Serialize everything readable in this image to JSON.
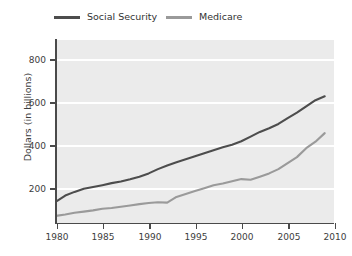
{
  "chart_data": {
    "type": "line",
    "title": "",
    "xlabel": "",
    "ylabel": "Dollars (in billions)",
    "xlim": [
      1980,
      2010
    ],
    "ylim": [
      0,
      900
    ],
    "xticks": [
      1980,
      1985,
      1990,
      1995,
      2000,
      2005,
      2010
    ],
    "yticks": [
      200,
      400,
      600,
      800
    ],
    "grid": "horizontal",
    "legend_position": "top",
    "x": [
      1980,
      1981,
      1982,
      1983,
      1984,
      1985,
      1986,
      1987,
      1988,
      1989,
      1990,
      1991,
      1992,
      1993,
      1994,
      1995,
      1996,
      1997,
      1998,
      1999,
      2000,
      2001,
      2002,
      2003,
      2004,
      2005,
      2006,
      2007,
      2008,
      2009
    ],
    "series": [
      {
        "name": "Social Security",
        "color": "#4d4d4d",
        "values": [
          105,
          135,
          153,
          168,
          177,
          186,
          196,
          204,
          215,
          228,
          244,
          265,
          283,
          299,
          313,
          328,
          343,
          358,
          372,
          385,
          402,
          425,
          448,
          466,
          487,
          516,
          543,
          574,
          604,
          623
        ]
      },
      {
        "name": "Medicare",
        "color": "#9a9a9a",
        "values": [
          35,
          42,
          50,
          56,
          62,
          70,
          74,
          80,
          86,
          93,
          98,
          102,
          100,
          128,
          143,
          157,
          171,
          186,
          194,
          205,
          216,
          213,
          228,
          244,
          265,
          295,
          324,
          368,
          400,
          442
        ]
      }
    ]
  },
  "legend": {
    "entries": [
      {
        "label": "Social Security",
        "color": "#4d4d4d"
      },
      {
        "label": "Medicare",
        "color": "#9a9a9a"
      }
    ]
  },
  "axes": {
    "y_title": "Dollars (in billions)",
    "y_tick_labels": [
      "200",
      "400",
      "600",
      "800"
    ],
    "x_tick_labels": [
      "1980",
      "1985",
      "1990",
      "1995",
      "2000",
      "2005",
      "2010"
    ]
  },
  "colors": {
    "plot_background": "#ebebeb",
    "gridline": "#ffffff",
    "axis": "#4a4a4a",
    "text": "#3d3d3d",
    "page_background": "#ffffff"
  }
}
